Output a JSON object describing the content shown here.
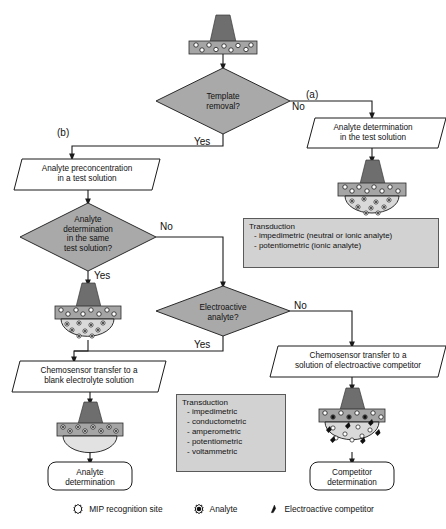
{
  "figure": {
    "colors": {
      "diamond_fill": "#a9a9a9",
      "transduction_fill": "#d2d2d2",
      "electrode_fill": "#6e6e6e",
      "mip_layer_fill": "#a5a5a5",
      "solution_fill": "#d9d9d9",
      "line": "#1a1a1a"
    }
  },
  "nodes": {
    "start_sensor": {
      "name": "mip-chemosensor-with-template"
    },
    "d1": {
      "line1": "Template",
      "line2": "removal?"
    },
    "branch_a": "(a)",
    "branch_b": "(b)",
    "d1_no": "No",
    "d1_yes": "Yes",
    "p_right1": {
      "line1": "Analyte determination",
      "line2": "in the test solution"
    },
    "sensor_right1": {
      "name": "chemosensor-in-test-solution"
    },
    "p_left1": {
      "line1": "Analyte preconcentration",
      "line2": "in a test solution"
    },
    "d2": {
      "line1": "Analyte",
      "line2": "determination",
      "line3": "in the same",
      "line4": "test solution?"
    },
    "d2_no": "No",
    "d2_yes": "Yes",
    "sensor_left_mid": {
      "name": "chemosensor-in-analyte-solution"
    },
    "d3": {
      "line1": "Electroactive",
      "line2": "analyte?"
    },
    "d3_no": "No",
    "d3_yes": "Yes",
    "p_left2": {
      "line1": "Chemosensor transfer to a",
      "line2": "blank electrolyte solution"
    },
    "p_right2": {
      "line1": "Chemosensor transfer to a",
      "line2": "solution of electroactive competitor"
    },
    "sensor_left_bottom": {
      "name": "chemosensor-in-blank-electrolyte"
    },
    "sensor_right_bottom": {
      "name": "chemosensor-with-competitor"
    },
    "end_left": {
      "line1": "Analyte",
      "line2": "determination"
    },
    "end_right": {
      "line1": "Competitor",
      "line2": "determination"
    }
  },
  "transduction_top": {
    "title": "Transduction",
    "items": [
      "- impedimetric (neutral or ionic analyte)",
      "- potentiometric (ionic analyte)"
    ]
  },
  "transduction_bottom": {
    "title": "Transduction",
    "items": [
      "- impedimetric",
      "- conductometric",
      "- amperometric",
      "- potentiometric",
      "- voltammetric"
    ]
  },
  "legend": {
    "items": [
      {
        "icon": "mip-recognition-site-icon",
        "label": "MIP recognition site"
      },
      {
        "icon": "analyte-icon",
        "label": "Analyte"
      },
      {
        "icon": "electroactive-competitor-icon",
        "label": "Electroactive competitor"
      }
    ]
  }
}
